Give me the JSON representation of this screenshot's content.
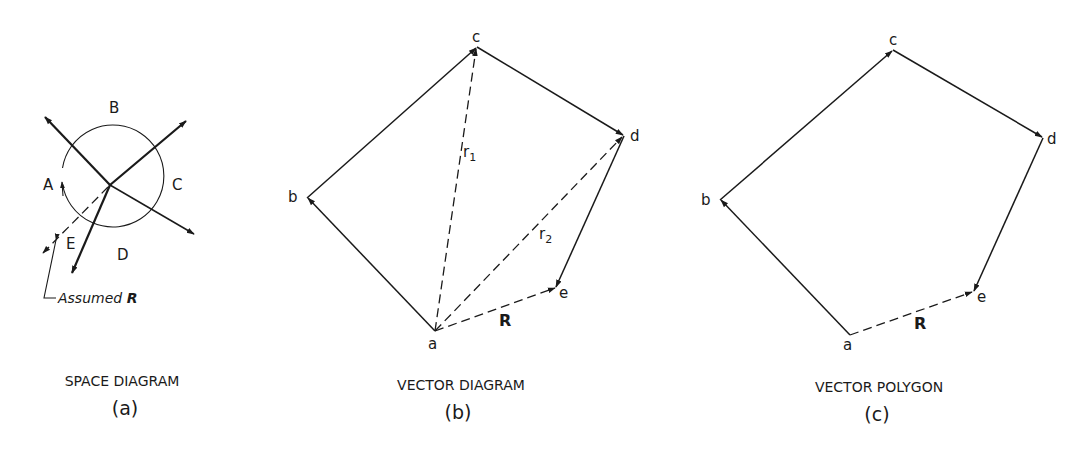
{
  "figure": {
    "panels": [
      {
        "id": "a",
        "caption": "SPACE DIAGRAM",
        "sublabel": "(a)",
        "space_labels": [
          "A",
          "B",
          "C",
          "D",
          "E"
        ],
        "annotation": {
          "text": "Assumed ",
          "bold_symbol": "R"
        }
      },
      {
        "id": "b",
        "caption": "VECTOR DIAGRAM",
        "sublabel": "(b)",
        "vertices": [
          "a",
          "b",
          "c",
          "d",
          "e"
        ],
        "resultant_label": "R",
        "intermediate": [
          {
            "base": "r",
            "sub": "1"
          },
          {
            "base": "r",
            "sub": "2"
          }
        ]
      },
      {
        "id": "c",
        "caption": "VECTOR POLYGON",
        "sublabel": "(c)",
        "vertices": [
          "a",
          "b",
          "c",
          "d",
          "e"
        ],
        "resultant_label": "R"
      }
    ]
  },
  "colors": {
    "ink": "#1a1a1a",
    "background": "#ffffff"
  }
}
